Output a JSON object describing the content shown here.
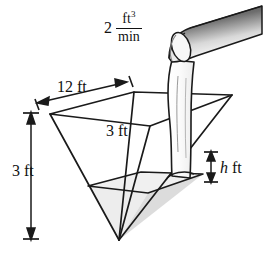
{
  "figure": {
    "background_color": "#ffffff",
    "stroke_color": "#1a1a1a",
    "water_fill_color": "#e6e6e6",
    "pipe_shade_dark": "#2b2b2b",
    "pipe_shade_light": "#f2f2f2"
  },
  "labels": {
    "flow_rate": {
      "coefficient": "2",
      "numerator": "ft",
      "numerator_exponent": "3",
      "denominator": "min",
      "full_text": "2 ft^3/min"
    },
    "top_width": "12 ft",
    "top_depth": "3 ft",
    "pyramid_height": "3 ft",
    "water_height": "h ft",
    "water_height_symbol": "h",
    "water_height_unit": "ft"
  },
  "geometry": {
    "top_rim": {
      "left": [
        50,
        114
      ],
      "back": [
        134,
        92
      ],
      "right": [
        232,
        95
      ],
      "front": [
        150,
        126
      ]
    },
    "apex": [
      119,
      240
    ],
    "water_surface": {
      "left": [
        88,
        186
      ],
      "back": [
        141,
        172
      ],
      "right": [
        203,
        174
      ],
      "front": [
        148,
        193
      ]
    },
    "dimension_lines": {
      "top_width_arrow": {
        "from": [
          38,
          103
        ],
        "to": [
          126,
          82
        ]
      },
      "height_arrow": {
        "from": [
          31,
          114
        ],
        "to": [
          31,
          238
        ]
      },
      "water_height_arrow": {
        "from": [
          211,
          152
        ],
        "to": [
          211,
          182
        ]
      }
    },
    "pipe": {
      "outlet": [
        185,
        58
      ],
      "far_end": [
        262,
        26
      ]
    },
    "stream": {
      "top": [
        178,
        62
      ],
      "bottom": [
        184,
        178
      ]
    }
  }
}
